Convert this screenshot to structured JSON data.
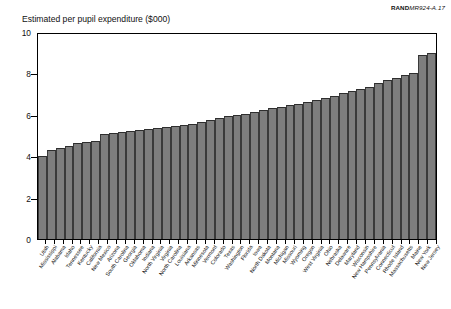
{
  "source_id": {
    "brand": "RAND",
    "rest": "MR924-A.17"
  },
  "chart_data": {
    "type": "bar",
    "title": "Estimated per pupil expenditure ($000)",
    "xlabel": "",
    "ylabel": "",
    "ylim": [
      0,
      10
    ],
    "yticks": [
      0,
      2,
      4,
      6,
      8,
      10
    ],
    "ytick_labels": [
      "0",
      "2",
      "4",
      "6",
      "8",
      "10"
    ],
    "grid": false,
    "legend": "none",
    "bar_color": "#7e7e7e",
    "categories": [
      "Utah",
      "Mississippi",
      "Alabama",
      "Idaho",
      "Tennessee",
      "Kentucky",
      "California",
      "New Mexico",
      "Arizona",
      "South Carolina",
      "Georgia",
      "Oklahoma",
      "Indiana",
      "North Virginia",
      "Virginia",
      "North Carolina",
      "Louisiana",
      "Arkansas",
      "Minnesota",
      "Vermont",
      "Colorado",
      "Texas",
      "Washington",
      "Florida",
      "Iowa",
      "North Dakota",
      "Montana",
      "Michigan",
      "Missouri",
      "Wyoming",
      "Oregon",
      "West Virginia",
      "Ohio",
      "Nebraska",
      "Delaware",
      "Maryland",
      "Wisconsin",
      "New Hampshire",
      "Pennsylvania",
      "Connecticut",
      "Rhode Island",
      "Massachusetts",
      "Maine",
      "New York",
      "New Jersey"
    ],
    "values": [
      4.05,
      4.35,
      4.45,
      4.55,
      4.7,
      4.75,
      4.8,
      5.1,
      5.15,
      5.2,
      5.25,
      5.3,
      5.35,
      5.4,
      5.45,
      5.5,
      5.55,
      5.6,
      5.7,
      5.8,
      5.9,
      6.0,
      6.05,
      6.1,
      6.2,
      6.3,
      6.4,
      6.45,
      6.55,
      6.6,
      6.7,
      6.8,
      6.9,
      7.0,
      7.1,
      7.2,
      7.3,
      7.4,
      7.6,
      7.75,
      7.85,
      8.0,
      8.1,
      9.0,
      9.05
    ]
  }
}
